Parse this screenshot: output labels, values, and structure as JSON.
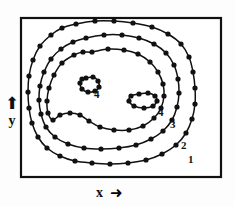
{
  "figure": {
    "type": "contour-plot",
    "background_color": "#fdfdfd",
    "ink_color": "#111111",
    "frame": {
      "x": 20,
      "y": 17,
      "width": 202,
      "height": 161,
      "stroke_width": 2.2
    }
  },
  "axes": {
    "x": {
      "label": "x",
      "arrow_glyph": "➜",
      "arrow_icon_name": "arrow-right-icon"
    },
    "y": {
      "label": "y",
      "arrow_glyph": "⬆",
      "arrow_icon_name": "arrow-up-icon"
    }
  },
  "chart_data": {
    "type": "line",
    "title": "",
    "xlabel": "x",
    "ylabel": "y",
    "grid": false,
    "legend": "none",
    "marker": "filled-circle",
    "marker_radius": 2.6,
    "levels": [
      {
        "label": "1",
        "label_x": 188,
        "label_y": 154,
        "closed": true,
        "role": "outermost-contour"
      },
      {
        "label": "2",
        "label_x": 181,
        "label_y": 140,
        "closed": true,
        "role": "second-contour"
      },
      {
        "label": "3",
        "label_x": 170,
        "label_y": 119,
        "closed": true,
        "role": "third-contour-peanut"
      },
      {
        "label": "4",
        "label_x": 94,
        "label_y": 89,
        "closed": true,
        "role": "left-peak-contour"
      },
      {
        "label": "4",
        "label_x": 158,
        "label_y": 107,
        "closed": true,
        "role": "right-peak-contour"
      }
    ],
    "curves": [
      {
        "name": "contour-1",
        "level": 1,
        "points": [
          [
            76,
            24
          ],
          [
            95,
            21
          ],
          [
            114,
            21
          ],
          [
            133,
            23
          ],
          [
            152,
            27
          ],
          [
            168,
            34
          ],
          [
            181,
            44
          ],
          [
            189,
            57
          ],
          [
            193,
            72
          ],
          [
            195,
            88
          ],
          [
            195,
            104
          ],
          [
            192,
            119
          ],
          [
            186,
            133
          ],
          [
            176,
            145
          ],
          [
            162,
            154
          ],
          [
            146,
            160
          ],
          [
            128,
            163
          ],
          [
            110,
            164
          ],
          [
            92,
            163
          ],
          [
            75,
            161
          ],
          [
            60,
            156
          ],
          [
            47,
            148
          ],
          [
            38,
            137
          ],
          [
            32,
            123
          ],
          [
            29,
            108
          ],
          [
            28,
            92
          ],
          [
            29,
            76
          ],
          [
            33,
            60
          ],
          [
            40,
            46
          ],
          [
            51,
            35
          ],
          [
            62,
            28
          ]
        ]
      },
      {
        "name": "contour-2",
        "level": 2,
        "points": [
          [
            86,
            38
          ],
          [
            104,
            35
          ],
          [
            122,
            35
          ],
          [
            139,
            38
          ],
          [
            154,
            44
          ],
          [
            166,
            53
          ],
          [
            174,
            65
          ],
          [
            178,
            79
          ],
          [
            179,
            93
          ],
          [
            177,
            107
          ],
          [
            172,
            120
          ],
          [
            163,
            131
          ],
          [
            151,
            139
          ],
          [
            136,
            145
          ],
          [
            119,
            148
          ],
          [
            101,
            149
          ],
          [
            84,
            148
          ],
          [
            68,
            144
          ],
          [
            55,
            137
          ],
          [
            46,
            127
          ],
          [
            41,
            114
          ],
          [
            39,
            100
          ],
          [
            40,
            86
          ],
          [
            44,
            72
          ],
          [
            51,
            59
          ],
          [
            61,
            49
          ],
          [
            73,
            42
          ]
        ]
      },
      {
        "name": "contour-3",
        "level": 3,
        "points": [
          [
            92,
            52
          ],
          [
            108,
            49
          ],
          [
            124,
            50
          ],
          [
            138,
            54
          ],
          [
            150,
            62
          ],
          [
            158,
            72
          ],
          [
            163,
            84
          ],
          [
            164,
            96
          ],
          [
            161,
            108
          ],
          [
            154,
            118
          ],
          [
            143,
            126
          ],
          [
            129,
            130
          ],
          [
            114,
            130
          ],
          [
            100,
            127
          ],
          [
            89,
            121
          ],
          [
            80,
            115
          ],
          [
            70,
            113
          ],
          [
            60,
            115
          ],
          [
            53,
            120
          ],
          [
            48,
            113
          ],
          [
            47,
            101
          ],
          [
            49,
            88
          ],
          [
            54,
            75
          ],
          [
            62,
            63
          ],
          [
            74,
            55
          ],
          [
            83,
            52
          ]
        ]
      },
      {
        "name": "peak-4-left",
        "level": 4,
        "points": [
          [
            86,
            78
          ],
          [
            93,
            77
          ],
          [
            98,
            81
          ],
          [
            99,
            87
          ],
          [
            95,
            91
          ],
          [
            88,
            92
          ],
          [
            82,
            89
          ],
          [
            80,
            83
          ],
          [
            82,
            79
          ]
        ]
      },
      {
        "name": "peak-4-right",
        "level": 4,
        "points": [
          [
            139,
            94
          ],
          [
            148,
            93
          ],
          [
            155,
            96
          ],
          [
            157,
            101
          ],
          [
            153,
            106
          ],
          [
            144,
            108
          ],
          [
            134,
            106
          ],
          [
            129,
            101
          ],
          [
            131,
            96
          ]
        ]
      }
    ]
  }
}
